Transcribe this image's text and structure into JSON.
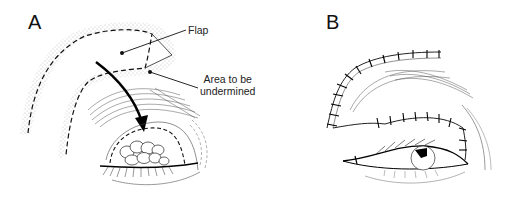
{
  "figure": {
    "panels": [
      {
        "letter": "A",
        "labels": {
          "flap": "Flap",
          "area_line1": "Area to be",
          "area_line2": "undermined"
        }
      },
      {
        "letter": "B"
      }
    ]
  }
}
